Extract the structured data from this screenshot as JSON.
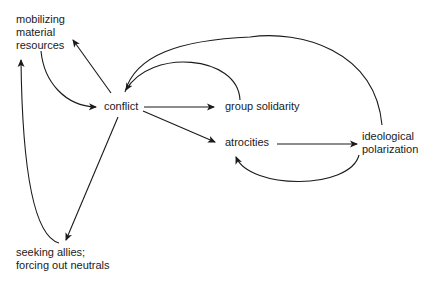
{
  "diagram": {
    "nodes": [
      {
        "id": "mobilizing",
        "lines": [
          "mobilizing",
          "material",
          "resources"
        ]
      },
      {
        "id": "conflict",
        "lines": [
          "conflict"
        ]
      },
      {
        "id": "group_solidarity",
        "lines": [
          "group solidarity"
        ]
      },
      {
        "id": "atrocities",
        "lines": [
          "atrocities"
        ]
      },
      {
        "id": "ideological_polarization",
        "lines": [
          "ideological",
          "polarization"
        ]
      },
      {
        "id": "seeking_allies",
        "lines": [
          "seeking allies;",
          "forcing out neutrals"
        ]
      }
    ],
    "edges": [
      {
        "from": "conflict",
        "to": "mobilizing"
      },
      {
        "from": "mobilizing",
        "to": "conflict"
      },
      {
        "from": "conflict",
        "to": "group_solidarity"
      },
      {
        "from": "group_solidarity",
        "to": "conflict"
      },
      {
        "from": "conflict",
        "to": "atrocities"
      },
      {
        "from": "atrocities",
        "to": "ideological_polarization"
      },
      {
        "from": "ideological_polarization",
        "to": "atrocities"
      },
      {
        "from": "ideological_polarization",
        "to": "conflict"
      },
      {
        "from": "conflict",
        "to": "seeking_allies"
      },
      {
        "from": "seeking_allies",
        "to": "mobilizing"
      }
    ],
    "line_color": "#1a1a1a"
  }
}
